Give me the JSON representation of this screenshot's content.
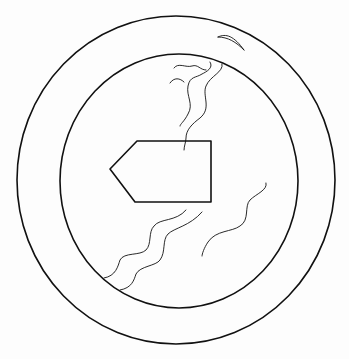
{
  "figure": {
    "colors": {
      "stroke": "#111111",
      "background": "#fdfdfd"
    },
    "outer_circle": {
      "cx": 176,
      "cy": 181,
      "r": 160
    },
    "inner_circle": {
      "cx": 178,
      "cy": 180,
      "rx": 119,
      "ry": 126
    },
    "pentagon_points": "110,168 137,141 211,141 211,202 135,202"
  }
}
